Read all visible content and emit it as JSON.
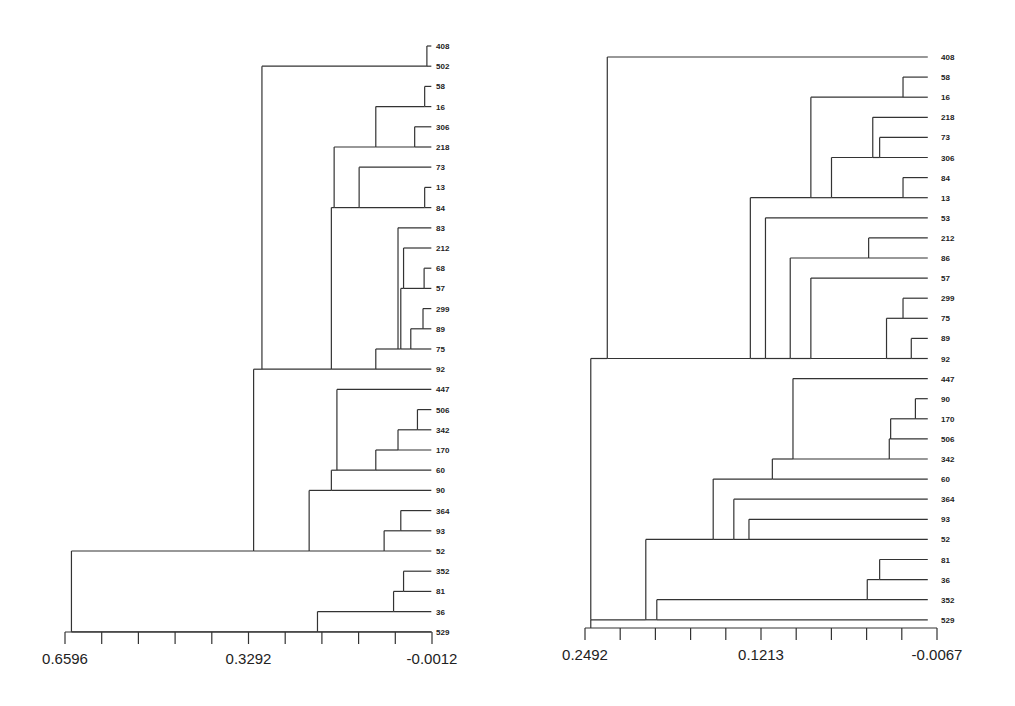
{
  "chart_data": [
    {
      "type": "dendrogram",
      "title": "",
      "orientation": "leaves-right",
      "axis": {
        "xlim": [
          0.6596,
          -0.0012
        ],
        "tick_labels": [
          "0.6596",
          "0.3292",
          "-0.0012"
        ],
        "tick_count": 11,
        "px": {
          "left": 65,
          "right": 432,
          "y": 632
        }
      },
      "leaf_layout": {
        "top_y": 46,
        "step": 20.2,
        "label_x": 436
      },
      "leaves": [
        "408",
        "502",
        "58",
        "16",
        "306",
        "218",
        "73",
        "13",
        "84",
        "83",
        "212",
        "68",
        "57",
        "299",
        "89",
        "75",
        "92",
        "447",
        "506",
        "342",
        "170",
        "60",
        "90",
        "364",
        "93",
        "52",
        "352",
        "81",
        "36",
        "529"
      ],
      "merges": [
        {
          "id": "a1",
          "children": [
            "408",
            "502"
          ],
          "height": 0.008
        },
        {
          "id": "a2",
          "children": [
            "58",
            "16"
          ],
          "height": 0.012
        },
        {
          "id": "a3",
          "children": [
            "306",
            "218"
          ],
          "height": 0.03
        },
        {
          "id": "a4",
          "children": [
            "a2",
            "a3"
          ],
          "height": 0.1
        },
        {
          "id": "a5",
          "children": [
            "13",
            "84"
          ],
          "height": 0.012
        },
        {
          "id": "a6",
          "children": [
            "73",
            "a5"
          ],
          "height": 0.13
        },
        {
          "id": "a7",
          "children": [
            "a4",
            "a6"
          ],
          "height": 0.175
        },
        {
          "id": "a8",
          "children": [
            "68",
            "57"
          ],
          "height": 0.013
        },
        {
          "id": "a9",
          "children": [
            "212",
            "a8"
          ],
          "height": 0.05
        },
        {
          "id": "a10",
          "children": [
            "299",
            "89"
          ],
          "height": 0.015
        },
        {
          "id": "a11",
          "children": [
            "a10",
            "75"
          ],
          "height": 0.037
        },
        {
          "id": "a12",
          "children": [
            "a9",
            "a11"
          ],
          "height": 0.055
        },
        {
          "id": "a13",
          "children": [
            "83",
            "a12"
          ],
          "height": 0.06
        },
        {
          "id": "a14",
          "children": [
            "a13",
            "92"
          ],
          "height": 0.1
        },
        {
          "id": "a15",
          "children": [
            "a7",
            "a14"
          ],
          "height": 0.18
        },
        {
          "id": "a16",
          "children": [
            "a1",
            "a15"
          ],
          "height": 0.305
        },
        {
          "id": "a17",
          "children": [
            "506",
            "342"
          ],
          "height": 0.025
        },
        {
          "id": "a18",
          "children": [
            "a17",
            "170"
          ],
          "height": 0.06
        },
        {
          "id": "a19",
          "children": [
            "a18",
            "60"
          ],
          "height": 0.1
        },
        {
          "id": "a20",
          "children": [
            "447",
            "a19"
          ],
          "height": 0.17
        },
        {
          "id": "a21",
          "children": [
            "364",
            "93"
          ],
          "height": 0.055
        },
        {
          "id": "a22",
          "children": [
            "a21",
            "52"
          ],
          "height": 0.085
        },
        {
          "id": "a23",
          "children": [
            "a20",
            "90"
          ],
          "height": 0.18
        },
        {
          "id": "a24",
          "children": [
            "a23",
            "a22"
          ],
          "height": 0.22
        },
        {
          "id": "a25",
          "children": [
            "a16",
            "a24"
          ],
          "height": 0.32
        },
        {
          "id": "a26",
          "children": [
            "352",
            "81"
          ],
          "height": 0.05
        },
        {
          "id": "a27",
          "children": [
            "a26",
            "36"
          ],
          "height": 0.068
        },
        {
          "id": "a28",
          "children": [
            "a27",
            "529"
          ],
          "height": 0.205
        },
        {
          "id": "a29",
          "children": [
            "a25",
            "a28"
          ],
          "height": 0.648
        }
      ]
    },
    {
      "type": "dendrogram",
      "title": "",
      "orientation": "leaves-right",
      "axis": {
        "xlim": [
          0.2492,
          -0.0067
        ],
        "tick_labels": [
          "0.2492",
          "0.1213",
          "-0.0067"
        ],
        "tick_count": 11,
        "px": {
          "left": 45,
          "right": 397,
          "y": 628
        }
      },
      "leaf_layout": {
        "top_y": 57,
        "step": 20.1,
        "label_x": 401
      },
      "leaves": [
        "408",
        "58",
        "16",
        "218",
        "73",
        "306",
        "84",
        "13",
        "53",
        "212",
        "86",
        "57",
        "299",
        "75",
        "89",
        "92",
        "447",
        "90",
        "170",
        "506",
        "342",
        "60",
        "364",
        "93",
        "52",
        "81",
        "36",
        "352",
        "529"
      ],
      "merges": [
        {
          "id": "b1",
          "children": [
            "58",
            "16"
          ],
          "height": 0.018
        },
        {
          "id": "b2",
          "children": [
            "73",
            "306"
          ],
          "height": 0.035
        },
        {
          "id": "b3",
          "children": [
            "218",
            "b2"
          ],
          "height": 0.04
        },
        {
          "id": "b4",
          "children": [
            "84",
            "13"
          ],
          "height": 0.018
        },
        {
          "id": "b5",
          "children": [
            "b3",
            "b4"
          ],
          "height": 0.07
        },
        {
          "id": "b6",
          "children": [
            "b1",
            "b5"
          ],
          "height": 0.085
        },
        {
          "id": "b7",
          "children": [
            "212",
            "86"
          ],
          "height": 0.043
        },
        {
          "id": "b8",
          "children": [
            "299",
            "75"
          ],
          "height": 0.018
        },
        {
          "id": "b9",
          "children": [
            "89",
            "92"
          ],
          "height": 0.012
        },
        {
          "id": "b10",
          "children": [
            "b8",
            "b9"
          ],
          "height": 0.03
        },
        {
          "id": "b11",
          "children": [
            "57",
            "b10"
          ],
          "height": 0.085
        },
        {
          "id": "b12",
          "children": [
            "b7",
            "b11"
          ],
          "height": 0.1
        },
        {
          "id": "b13",
          "children": [
            "53",
            "b12"
          ],
          "height": 0.118
        },
        {
          "id": "b14",
          "children": [
            "b6",
            "b13"
          ],
          "height": 0.129
        },
        {
          "id": "b15",
          "children": [
            "408",
            "b14"
          ],
          "height": 0.233
        },
        {
          "id": "b16",
          "children": [
            "90",
            "170"
          ],
          "height": 0.009
        },
        {
          "id": "b17",
          "children": [
            "b16",
            "506"
          ],
          "height": 0.027
        },
        {
          "id": "b18",
          "children": [
            "b17",
            "342"
          ],
          "height": 0.028
        },
        {
          "id": "b19",
          "children": [
            "447",
            "b18"
          ],
          "height": 0.098
        },
        {
          "id": "b20",
          "children": [
            "b19",
            "60"
          ],
          "height": 0.113
        },
        {
          "id": "b21",
          "children": [
            "93",
            "52"
          ],
          "height": 0.13
        },
        {
          "id": "b22",
          "children": [
            "364",
            "b21"
          ],
          "height": 0.141
        },
        {
          "id": "b23",
          "children": [
            "b20",
            "b22"
          ],
          "height": 0.156
        },
        {
          "id": "b24",
          "children": [
            "81",
            "36"
          ],
          "height": 0.035
        },
        {
          "id": "b25",
          "children": [
            "b24",
            "352"
          ],
          "height": 0.044
        },
        {
          "id": "b26",
          "children": [
            "b25",
            "529"
          ],
          "height": 0.197
        },
        {
          "id": "b27",
          "children": [
            "b23",
            "b26"
          ],
          "height": 0.205
        },
        {
          "id": "b28",
          "children": [
            "b15",
            "b27"
          ],
          "height": 0.245
        }
      ]
    }
  ],
  "labels": {
    "left_axis_min": "0.6596",
    "left_axis_mid": "0.3292",
    "left_axis_max": "-0.0012",
    "right_axis_min": "0.2492",
    "right_axis_mid": "0.1213",
    "right_axis_max": "-0.0067",
    "caption_fragment": "2 Different ... Th"
  }
}
